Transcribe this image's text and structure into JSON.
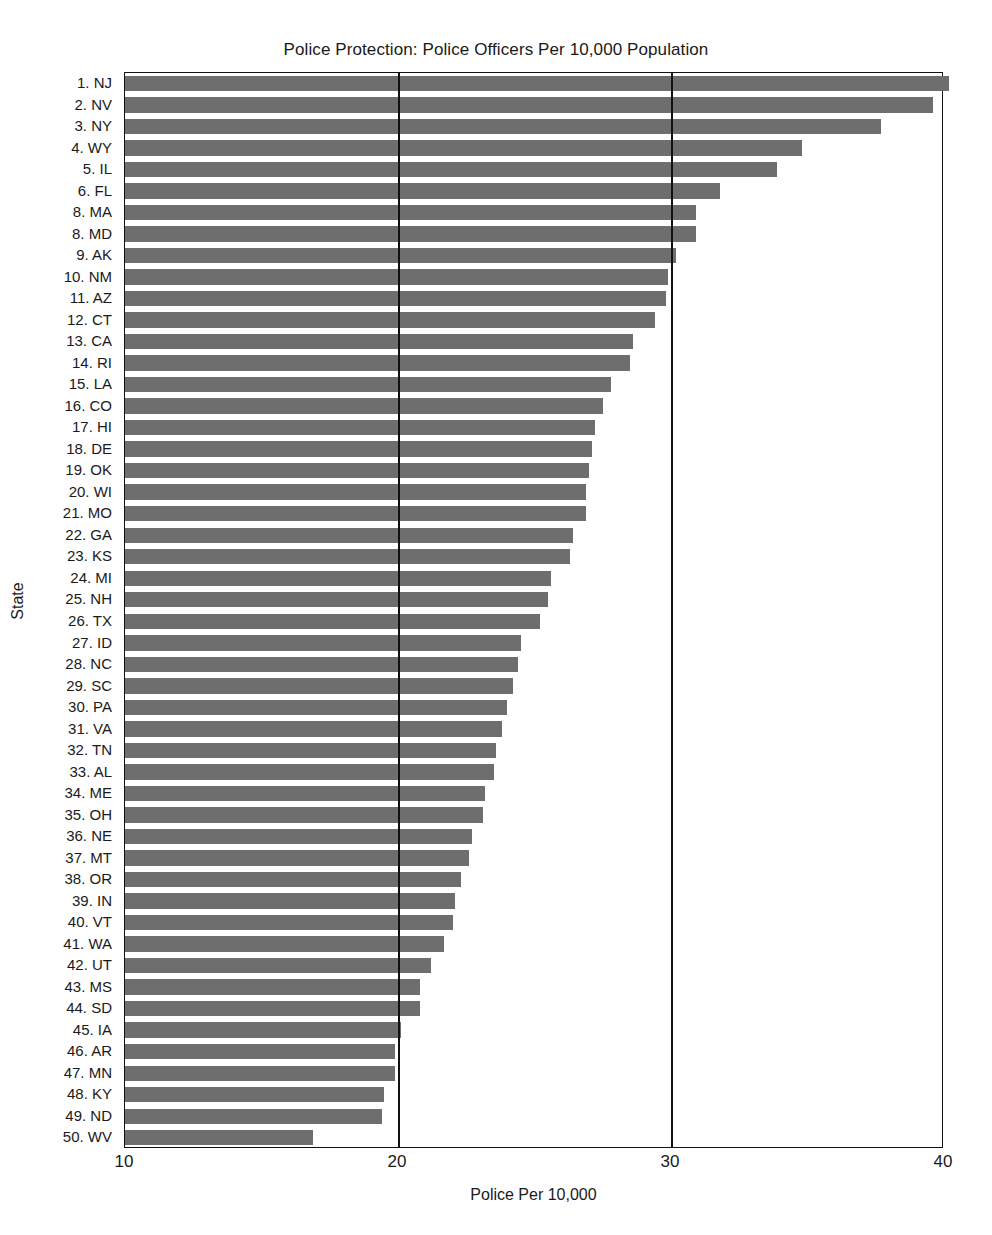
{
  "chart_data": {
    "type": "bar",
    "orientation": "horizontal",
    "title": "Police Protection: Police Officers Per 10,000 Population",
    "xlabel": "Police Per 10,000",
    "ylabel": "State",
    "xlim": [
      10,
      40
    ],
    "xticks": [
      "10",
      "20",
      "30",
      "40"
    ],
    "xtick_values": [
      10,
      20,
      30,
      40
    ],
    "grid": "vertical gridlines at 20 and 30",
    "legend": "none",
    "bar_color": "#6e6e6e",
    "categories": [
      "1. NJ",
      "2. NV",
      "3. NY",
      "4. WY",
      "5. IL",
      "6. FL",
      "8. MA",
      "8. MD",
      "9. AK",
      "10. NM",
      "11. AZ",
      "12. CT",
      "13. CA",
      "14. RI",
      "15. LA",
      "16. CO",
      "17. HI",
      "18. DE",
      "19. OK",
      "20. WI",
      "21. MO",
      "22. GA",
      "23. KS",
      "24. MI",
      "25. NH",
      "26. TX",
      "27. ID",
      "28. NC",
      "29. SC",
      "30. PA",
      "31. VA",
      "32. TN",
      "33. AL",
      "34. ME",
      "35. OH",
      "36. NE",
      "37. MT",
      "38. OR",
      "39. IN",
      "40. VT",
      "41. WA",
      "42. UT",
      "43. MS",
      "44. SD",
      "45. IA",
      "46. AR",
      "47. MN",
      "48. KY",
      "49. ND",
      "50. WV"
    ],
    "values": [
      40.2,
      39.6,
      37.7,
      34.8,
      33.9,
      31.8,
      30.9,
      30.9,
      30.2,
      29.9,
      29.8,
      29.4,
      28.6,
      28.5,
      27.8,
      27.5,
      27.2,
      27.1,
      27.0,
      26.9,
      26.9,
      26.4,
      26.3,
      25.6,
      25.5,
      25.2,
      24.5,
      24.4,
      24.2,
      24.0,
      23.8,
      23.6,
      23.5,
      23.2,
      23.1,
      22.7,
      22.6,
      22.3,
      22.1,
      22.0,
      21.7,
      21.2,
      20.8,
      20.8,
      20.1,
      19.9,
      19.9,
      19.5,
      19.4,
      16.9
    ]
  }
}
